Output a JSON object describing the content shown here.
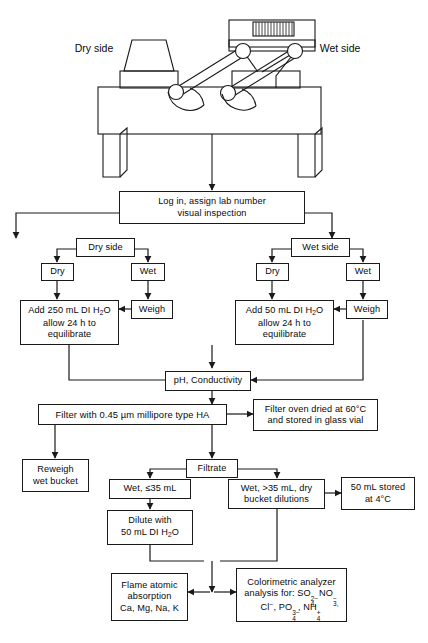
{
  "figure": {
    "type": "process-flow-diagram"
  },
  "apparatus": {
    "name": "wet-dry-precipitation-collector",
    "dry_side_label_line1": "Dry",
    "dry_side_label_line2": "side",
    "wet_side_label_line1": "Wet",
    "wet_side_label_line2": "side"
  },
  "nodes": {
    "login": {
      "line1": "Log in, assign lab number",
      "line2": "visual inspection"
    },
    "dry_side": {
      "line1": "Dry side"
    },
    "wet_side": {
      "line1": "Wet side"
    },
    "dry_side_dry": {
      "line1": "Dry"
    },
    "dry_side_wet": {
      "line1": "Wet"
    },
    "wet_side_dry": {
      "line1": "Dry"
    },
    "wet_side_wet": {
      "line1": "Wet"
    },
    "weigh_left": {
      "line1": "Weigh"
    },
    "weigh_right": {
      "line1": "Weigh"
    },
    "add_250": {
      "line1": "Add 250 mL DI H2O",
      "line2": "allow 24 h to",
      "line3": "equilibrate"
    },
    "add_50": {
      "line1": "Add 50 mL DI H2O",
      "line2": "allow 24 h to",
      "line3": "equilibrate"
    },
    "ph_cond": {
      "line1": "pH, Conductivity"
    },
    "filter": {
      "line1": "Filter with 0.45 µm millipore type HA"
    },
    "filter_oven": {
      "line1": "Filter oven dried at 60°C",
      "line2": "and stored in glass vial"
    },
    "reweigh": {
      "line1": "Reweigh",
      "line2": "wet bucket"
    },
    "filtrate": {
      "line1": "Filtrate"
    },
    "wet_le35": {
      "line1": "Wet, ≤35 mL"
    },
    "wet_gt35": {
      "line1": "Wet, >35 mL, dry",
      "line2": "bucket dilutions"
    },
    "stored_50": {
      "line1": "50 mL stored",
      "line2": "at 4°C"
    },
    "dilute": {
      "line1": "Dilute with",
      "line2": "50 mL DI H2O"
    },
    "flame": {
      "line1": "Flame atomic",
      "line2": "absorption",
      "line3": "Ca, Mg, Na, K"
    },
    "colorimetric": {
      "line1": "Colorimetric analyzer",
      "line2": "analysis for: SO4(2-), NO3(-),",
      "line3": "Cl(-), PO4(3-), NH4(+)"
    }
  },
  "chemistry": {
    "di_water": "H2O",
    "analytes_flame": [
      "Ca",
      "Mg",
      "Na",
      "K"
    ],
    "analytes_colorimetric": [
      "SO4 2-",
      "NO3 -",
      "Cl -",
      "PO4 3-",
      "NH4 +"
    ]
  },
  "parameters": {
    "dry_side_water_volume": "250 mL",
    "wet_side_water_volume": "50 mL",
    "equilibration_time": "24 h",
    "filter_pore_size": "0.45 µm",
    "filter_type": "millipore type HA",
    "oven_temperature": "60°C",
    "storage_temperature": "4°C",
    "dilution_volume": "50 mL",
    "volume_threshold": "35 mL",
    "stored_aliquot": "50 mL"
  },
  "colors": {
    "line": "#1a1a1a",
    "background": "#ffffff",
    "text": "#0a0a0a"
  }
}
